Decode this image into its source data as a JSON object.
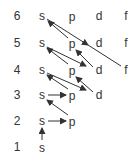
{
  "shells": [
    {
      "n": "6",
      "y": 16,
      "orbitals": [
        "s",
        "p",
        "d",
        "f"
      ]
    },
    {
      "n": "5",
      "y": 43,
      "orbitals": [
        "s",
        "p",
        "d",
        "f"
      ]
    },
    {
      "n": "4",
      "y": 70,
      "orbitals": [
        "s",
        "p",
        "d",
        "f"
      ]
    },
    {
      "n": "3",
      "y": 95,
      "orbitals": [
        "s",
        "p",
        "d"
      ]
    },
    {
      "n": "2",
      "y": 121,
      "orbitals": [
        "s",
        "p"
      ]
    },
    {
      "n": "1",
      "y": 147,
      "orbitals": [
        "s"
      ]
    }
  ],
  "columns_x": {
    "n": 17,
    "s": 42,
    "p": 72,
    "d": 99,
    "f": 126
  },
  "filling_order": [
    "1s",
    "2s",
    "2p",
    "3s",
    "3p",
    "4s",
    "3d",
    "4p",
    "5s",
    "4d",
    "5p",
    "6s",
    "4f",
    "5d"
  ],
  "labels": {
    "r6": {
      "n": "6",
      "s": "s",
      "p": "p",
      "d": "d",
      "f": "f"
    },
    "r5": {
      "n": "5",
      "s": "s",
      "p": "p",
      "d": "d",
      "f": "f"
    },
    "r4": {
      "n": "4",
      "s": "s",
      "p": "p",
      "d": "d",
      "f": "f"
    },
    "r3": {
      "n": "3",
      "s": "s",
      "p": "p",
      "d": "d"
    },
    "r2": {
      "n": "2",
      "s": "s",
      "p": "p"
    },
    "r1": {
      "n": "1",
      "s": "s"
    }
  },
  "colors": {
    "text": "#333333",
    "arrow": "#333333"
  }
}
